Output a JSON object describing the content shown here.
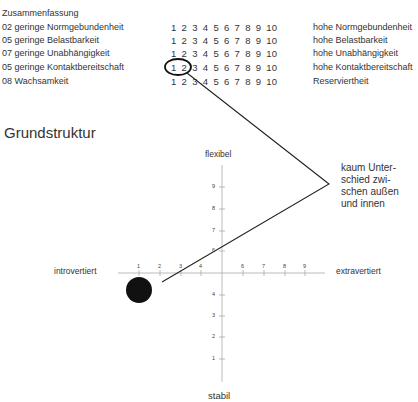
{
  "summary": {
    "heading": "Zusammenfassung",
    "rows": [
      {
        "left": "02 geringe Normgebundenheit",
        "scale": [
          "1",
          "2",
          "3",
          "4",
          "5",
          "6",
          "7",
          "8",
          "9",
          "10"
        ],
        "right": "hohe Normgebundenheit"
      },
      {
        "left": "05 geringe Belastbarkeit",
        "scale": [
          "1",
          "2",
          "3",
          "4",
          "5",
          "6",
          "7",
          "8",
          "9",
          "10"
        ],
        "right": "hohe Belastbarkeit"
      },
      {
        "left": "07 geringe Unabhängigkeit",
        "scale": [
          "1",
          "2",
          "3",
          "4",
          "5",
          "6",
          "7",
          "8",
          "9",
          "10"
        ],
        "right": "hohe Unabhängigkeit"
      },
      {
        "left": "05 geringe Kontaktbereitschaft",
        "scale": [
          "1",
          "2",
          "3",
          "4",
          "5",
          "6",
          "7",
          "8",
          "9",
          "10"
        ],
        "right": "hohe Kontaktbereitschaft"
      },
      {
        "left": "08 Wachsamkeit",
        "scale": [
          "1",
          "2",
          "3",
          "4",
          "5",
          "6",
          "7",
          "8",
          "9",
          "10"
        ],
        "right": "Reserviertheit"
      }
    ],
    "highlighted_row": 3,
    "highlighted_values": [
      "1",
      "2"
    ]
  },
  "structure": {
    "title": "Grundstruktur",
    "axis_top": "flexibel",
    "axis_bottom": "stabil",
    "axis_left": "introvertiert",
    "axis_right": "extravertiert",
    "x_ticks": [
      "1",
      "2",
      "3",
      "4",
      "6",
      "7",
      "8",
      "9"
    ],
    "y_ticks_upper": [
      "9",
      "8",
      "7",
      "6"
    ],
    "y_ticks_lower": [
      "4",
      "3",
      "2",
      "1"
    ],
    "point": {
      "x": 1,
      "y": 4.7
    },
    "annotation": "kaum Unter-schied zwi-schen außen und innen",
    "annotation_lines": [
      "kaum Unter-",
      "schied zwi-",
      "schen außen",
      "und innen"
    ]
  },
  "colors": {
    "ink": "#222222",
    "axis": "#999999",
    "background": "#ffffff"
  }
}
